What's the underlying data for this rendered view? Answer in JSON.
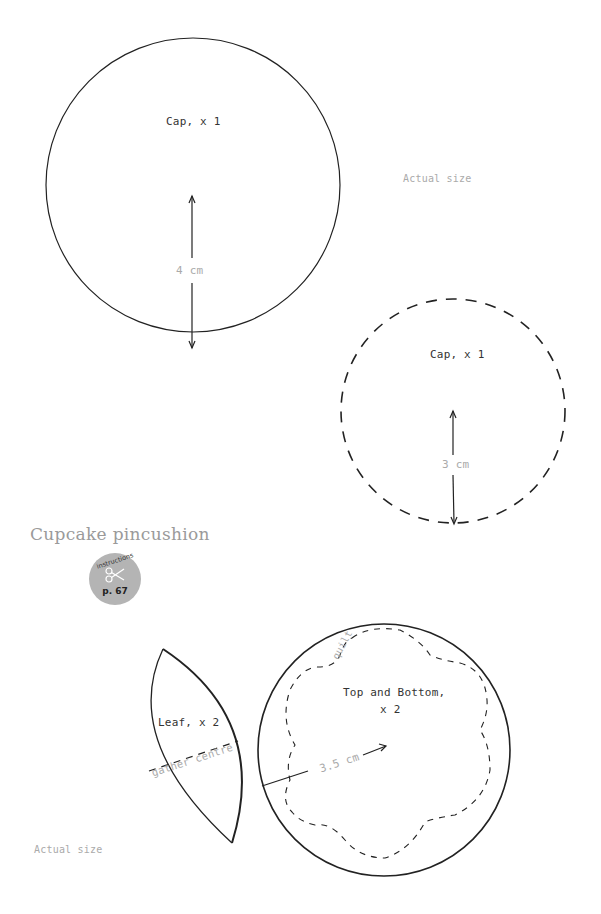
{
  "page": {
    "section_title": "Cupcake pincushion",
    "instructions_badge": {
      "label": "instructions",
      "page_ref": "p. 67",
      "icon": "scissors-icon",
      "color": "#b4b4b4"
    }
  },
  "patterns": {
    "cap_large": {
      "label": "Cap, x 1",
      "radius_label": "4 cm",
      "outline": "solid"
    },
    "cap_small": {
      "label": "Cap, x 1",
      "radius_label": "3 cm",
      "outline": "dashed"
    },
    "leaf": {
      "label": "Leaf, x 2",
      "gather_label": "gather centre"
    },
    "top_bottom": {
      "label_line1": "Top and Bottom,",
      "label_line2": "x 2",
      "radius_label": "3.5 cm",
      "quilt_label": "quilt"
    }
  },
  "notes": {
    "actual_size_top": "Actual size",
    "actual_size_bottom": "Actual size"
  },
  "colors": {
    "line": "#222222",
    "light_text": "#aaaaaa",
    "title_text": "#9a9a9a"
  }
}
